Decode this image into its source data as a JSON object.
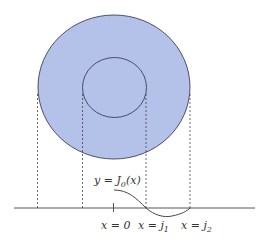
{
  "diagram": {
    "colors": {
      "fill": "#b4c1e8",
      "stroke": "#3a3f5c",
      "line": "#444444"
    },
    "outer_circle": {
      "cx": 114,
      "cy": 87,
      "rx": 76,
      "ry": 72
    },
    "inner_circle": {
      "cx": 114.5,
      "cy": 87.5,
      "rx": 32,
      "ry": 30
    },
    "axis": {
      "y": 208,
      "x_start": 14,
      "x_end": 255
    },
    "labels": {
      "curve": {
        "prefix": "y = J",
        "sub": "0",
        "suffix": "(x)"
      },
      "x0": {
        "text": "x = 0"
      },
      "xj1": {
        "prefix": "x = j",
        "sub": "1"
      },
      "xj2": {
        "prefix": "x = j",
        "sub": "2"
      }
    }
  }
}
